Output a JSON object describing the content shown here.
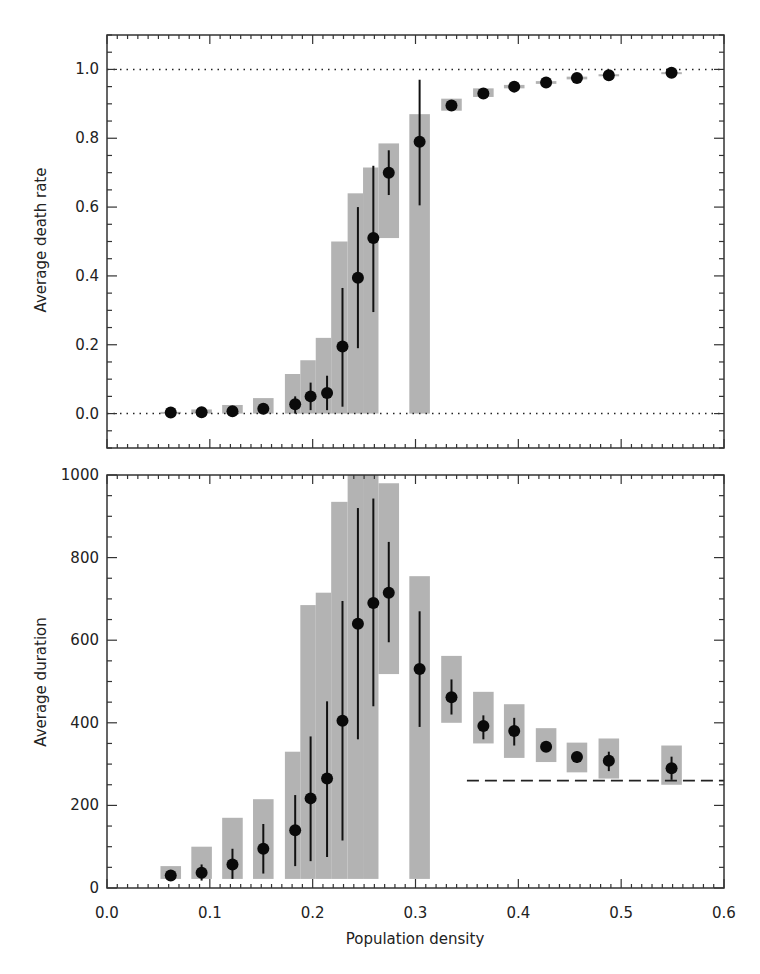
{
  "chart_data": [
    {
      "type": "scatter",
      "panel": "top",
      "title": "",
      "xlabel": "",
      "ylabel": "Average death rate",
      "xlim": [
        0.0,
        0.6
      ],
      "ylim": [
        -0.1,
        1.1
      ],
      "yticks": [
        "0.0",
        "0.2",
        "0.4",
        "0.6",
        "0.8",
        "1.0"
      ],
      "ytick_values": [
        0.0,
        0.2,
        0.4,
        0.6,
        0.8,
        1.0
      ],
      "reference_lines": [
        {
          "y": 1.0,
          "style": "dotted"
        },
        {
          "y": 0.0,
          "style": "dotted"
        }
      ],
      "grid": false,
      "points": [
        {
          "x": 0.062,
          "y": 0.003,
          "err_lo": 0.003,
          "err_hi": 0.003,
          "box_lo": 0.0,
          "box_hi": 0.005,
          "box_x0": 0.052,
          "box_x1": 0.072
        },
        {
          "x": 0.092,
          "y": 0.004,
          "err_lo": 0.004,
          "err_hi": 0.004,
          "box_lo": 0.0,
          "box_hi": 0.012,
          "box_x0": 0.082,
          "box_x1": 0.102
        },
        {
          "x": 0.122,
          "y": 0.007,
          "err_lo": 0.007,
          "err_hi": 0.007,
          "box_lo": 0.0,
          "box_hi": 0.025,
          "box_x0": 0.112,
          "box_x1": 0.132
        },
        {
          "x": 0.152,
          "y": 0.014,
          "err_lo": 0.014,
          "err_hi": 0.014,
          "box_lo": 0.0,
          "box_hi": 0.045,
          "box_x0": 0.142,
          "box_x1": 0.162
        },
        {
          "x": 0.183,
          "y": 0.027,
          "err_lo": 0.0,
          "err_hi": 0.05,
          "box_lo": 0.0,
          "box_hi": 0.115,
          "box_x0": 0.173,
          "box_x1": 0.188
        },
        {
          "x": 0.198,
          "y": 0.05,
          "err_lo": 0.01,
          "err_hi": 0.09,
          "box_lo": 0.0,
          "box_hi": 0.155,
          "box_x0": 0.188,
          "box_x1": 0.203
        },
        {
          "x": 0.214,
          "y": 0.06,
          "err_lo": 0.01,
          "err_hi": 0.11,
          "box_lo": 0.0,
          "box_hi": 0.22,
          "box_x0": 0.203,
          "box_x1": 0.218
        },
        {
          "x": 0.229,
          "y": 0.195,
          "err_lo": 0.02,
          "err_hi": 0.365,
          "box_lo": 0.0,
          "box_hi": 0.5,
          "box_x0": 0.218,
          "box_x1": 0.234
        },
        {
          "x": 0.244,
          "y": 0.395,
          "err_lo": 0.19,
          "err_hi": 0.6,
          "box_lo": 0.0,
          "box_hi": 0.64,
          "box_x0": 0.234,
          "box_x1": 0.249
        },
        {
          "x": 0.259,
          "y": 0.51,
          "err_lo": 0.295,
          "err_hi": 0.72,
          "box_lo": 0.0,
          "box_hi": 0.715,
          "box_x0": 0.249,
          "box_x1": 0.264
        },
        {
          "x": 0.274,
          "y": 0.7,
          "err_lo": 0.635,
          "err_hi": 0.765,
          "box_lo": 0.51,
          "box_hi": 0.785,
          "box_x0": 0.264,
          "box_x1": 0.284
        },
        {
          "x": 0.304,
          "y": 0.79,
          "err_lo": 0.605,
          "err_hi": 0.97,
          "box_lo": 0.0,
          "box_hi": 0.87,
          "box_x0": 0.294,
          "box_x1": 0.314
        },
        {
          "x": 0.335,
          "y": 0.895,
          "err_lo": 0.895,
          "err_hi": 0.895,
          "box_lo": 0.88,
          "box_hi": 0.915,
          "box_x0": 0.325,
          "box_x1": 0.345
        },
        {
          "x": 0.366,
          "y": 0.93,
          "err_lo": 0.93,
          "err_hi": 0.93,
          "box_lo": 0.92,
          "box_hi": 0.945,
          "box_x0": 0.356,
          "box_x1": 0.376
        },
        {
          "x": 0.396,
          "y": 0.95,
          "err_lo": 0.95,
          "err_hi": 0.95,
          "box_lo": 0.945,
          "box_hi": 0.955,
          "box_x0": 0.386,
          "box_x1": 0.406
        },
        {
          "x": 0.427,
          "y": 0.962,
          "err_lo": 0.962,
          "err_hi": 0.962,
          "box_lo": 0.958,
          "box_hi": 0.966,
          "box_x0": 0.417,
          "box_x1": 0.437
        },
        {
          "x": 0.457,
          "y": 0.975,
          "err_lo": 0.975,
          "err_hi": 0.975,
          "box_lo": 0.971,
          "box_hi": 0.979,
          "box_x0": 0.447,
          "box_x1": 0.467
        },
        {
          "x": 0.488,
          "y": 0.983,
          "err_lo": 0.983,
          "err_hi": 0.983,
          "box_lo": 0.98,
          "box_hi": 0.986,
          "box_x0": 0.478,
          "box_x1": 0.498
        },
        {
          "x": 0.549,
          "y": 0.99,
          "err_lo": 0.99,
          "err_hi": 0.99,
          "box_lo": 0.988,
          "box_hi": 0.992,
          "box_x0": 0.539,
          "box_x1": 0.559
        }
      ]
    },
    {
      "type": "scatter",
      "panel": "bottom",
      "title": "",
      "xlabel": "Population density",
      "ylabel": "Average duration",
      "xlim": [
        0.0,
        0.6
      ],
      "ylim": [
        0,
        1000
      ],
      "xticks": [
        "0.0",
        "0.1",
        "0.2",
        "0.3",
        "0.4",
        "0.5",
        "0.6"
      ],
      "xtick_values": [
        0.0,
        0.1,
        0.2,
        0.3,
        0.4,
        0.5,
        0.6
      ],
      "yticks": [
        "0",
        "200",
        "400",
        "600",
        "800",
        "1000"
      ],
      "ytick_values": [
        0,
        200,
        400,
        600,
        800,
        1000
      ],
      "reference_lines": [
        {
          "y": 260,
          "x0": 0.35,
          "x1": 0.6,
          "style": "dashed"
        }
      ],
      "grid": false,
      "points": [
        {
          "x": 0.062,
          "y": 30,
          "err_lo": 22,
          "err_hi": 38,
          "box_lo": 22,
          "box_hi": 53,
          "box_x0": 0.052,
          "box_x1": 0.072
        },
        {
          "x": 0.092,
          "y": 37,
          "err_lo": 18,
          "err_hi": 57,
          "box_lo": 22,
          "box_hi": 100,
          "box_x0": 0.082,
          "box_x1": 0.102
        },
        {
          "x": 0.122,
          "y": 57,
          "err_lo": 22,
          "err_hi": 95,
          "box_lo": 22,
          "box_hi": 170,
          "box_x0": 0.112,
          "box_x1": 0.132
        },
        {
          "x": 0.152,
          "y": 95,
          "err_lo": 35,
          "err_hi": 155,
          "box_lo": 22,
          "box_hi": 215,
          "box_x0": 0.142,
          "box_x1": 0.162
        },
        {
          "x": 0.183,
          "y": 140,
          "err_lo": 53,
          "err_hi": 225,
          "box_lo": 22,
          "box_hi": 330,
          "box_x0": 0.173,
          "box_x1": 0.188
        },
        {
          "x": 0.198,
          "y": 217,
          "err_lo": 65,
          "err_hi": 367,
          "box_lo": 22,
          "box_hi": 685,
          "box_x0": 0.188,
          "box_x1": 0.203
        },
        {
          "x": 0.214,
          "y": 265,
          "err_lo": 75,
          "err_hi": 452,
          "box_lo": 22,
          "box_hi": 715,
          "box_x0": 0.203,
          "box_x1": 0.218
        },
        {
          "x": 0.229,
          "y": 405,
          "err_lo": 115,
          "err_hi": 695,
          "box_lo": 22,
          "box_hi": 935,
          "box_x0": 0.218,
          "box_x1": 0.234
        },
        {
          "x": 0.244,
          "y": 640,
          "err_lo": 360,
          "err_hi": 920,
          "box_lo": 22,
          "box_hi": 1000,
          "box_x0": 0.234,
          "box_x1": 0.249
        },
        {
          "x": 0.259,
          "y": 690,
          "err_lo": 440,
          "err_hi": 943,
          "box_lo": 22,
          "box_hi": 1000,
          "box_x0": 0.249,
          "box_x1": 0.264
        },
        {
          "x": 0.274,
          "y": 715,
          "err_lo": 595,
          "err_hi": 838,
          "box_lo": 518,
          "box_hi": 980,
          "box_x0": 0.264,
          "box_x1": 0.284
        },
        {
          "x": 0.304,
          "y": 530,
          "err_lo": 390,
          "err_hi": 670,
          "box_lo": 22,
          "box_hi": 755,
          "box_x0": 0.294,
          "box_x1": 0.314
        },
        {
          "x": 0.335,
          "y": 462,
          "err_lo": 420,
          "err_hi": 505,
          "box_lo": 400,
          "box_hi": 562,
          "box_x0": 0.325,
          "box_x1": 0.345
        },
        {
          "x": 0.366,
          "y": 392,
          "err_lo": 360,
          "err_hi": 418,
          "box_lo": 350,
          "box_hi": 475,
          "box_x0": 0.356,
          "box_x1": 0.376
        },
        {
          "x": 0.396,
          "y": 380,
          "err_lo": 345,
          "err_hi": 412,
          "box_lo": 315,
          "box_hi": 445,
          "box_x0": 0.386,
          "box_x1": 0.406
        },
        {
          "x": 0.427,
          "y": 342,
          "err_lo": 330,
          "err_hi": 355,
          "box_lo": 305,
          "box_hi": 387,
          "box_x0": 0.417,
          "box_x1": 0.437
        },
        {
          "x": 0.457,
          "y": 317,
          "err_lo": 303,
          "err_hi": 330,
          "box_lo": 280,
          "box_hi": 352,
          "box_x0": 0.447,
          "box_x1": 0.467
        },
        {
          "x": 0.488,
          "y": 308,
          "err_lo": 283,
          "err_hi": 330,
          "box_lo": 265,
          "box_hi": 362,
          "box_x0": 0.478,
          "box_x1": 0.498
        },
        {
          "x": 0.549,
          "y": 290,
          "err_lo": 262,
          "err_hi": 318,
          "box_lo": 250,
          "box_hi": 345,
          "box_x0": 0.539,
          "box_x1": 0.559
        }
      ]
    }
  ]
}
